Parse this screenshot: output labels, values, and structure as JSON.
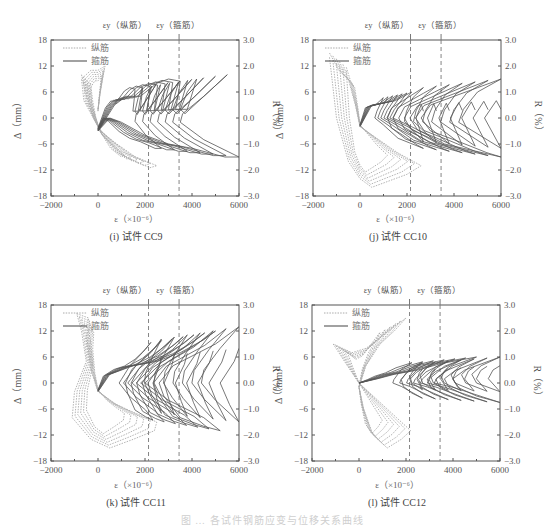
{
  "figure": {
    "caption": "图 … 各试件钢筋应变与位移关系曲线"
  },
  "colors": {
    "longitudinal": "#aaaaaa",
    "stirrup": "#555555",
    "axis": "#555555",
    "yield_line": "#777777"
  },
  "chart_data": [
    {
      "type": "line",
      "title": "(i) 试件 CC9",
      "xlabel": "ε（×10⁻⁶）",
      "ylabel": "Δ（mm）",
      "ylabel_right": "R（%）",
      "xlim": [
        -2000,
        6000
      ],
      "ylim": [
        -18,
        18
      ],
      "ylim_right": [
        -3.0,
        3.0
      ],
      "xticks": [
        -2000,
        0,
        2000,
        4000,
        6000
      ],
      "yticks": [
        -18,
        -12,
        -6,
        0,
        6,
        12,
        18
      ],
      "yticks_right": [
        "-3.0",
        "-2.0",
        "-1.0",
        "0.0",
        "1.0",
        "2.0",
        "3.0"
      ],
      "legend": [
        "纵筋",
        "箍筋"
      ],
      "vlines": [
        {
          "x": 2150,
          "label": "εy（纵筋）"
        },
        {
          "x": 3450,
          "label": "εy（箍筋）"
        }
      ],
      "series": [
        {
          "name": "纵筋",
          "style": "dotted",
          "points": [
            [
              -700,
              10
            ],
            [
              -500,
              5
            ],
            [
              -200,
              0
            ],
            [
              100,
              -3
            ],
            [
              800,
              -6
            ],
            [
              1600,
              -9
            ],
            [
              2500,
              -11
            ],
            [
              2200,
              -11.5
            ],
            [
              1200,
              -9
            ],
            [
              200,
              -4
            ],
            [
              -600,
              4
            ],
            [
              -700,
              9
            ],
            [
              -300,
              11
            ],
            [
              0,
              11
            ],
            [
              300,
              12
            ],
            [
              100,
              6
            ],
            [
              0,
              2
            ]
          ]
        },
        {
          "name": "箍筋",
          "style": "solid",
          "points": [
            [
              0,
              -3
            ],
            [
              700,
              3
            ],
            [
              1200,
              5
            ],
            [
              1800,
              5
            ],
            [
              2500,
              8
            ],
            [
              3000,
              9
            ],
            [
              3500,
              8.5
            ],
            [
              3400,
              5
            ],
            [
              3300,
              2
            ],
            [
              3800,
              2
            ],
            [
              4200,
              9
            ],
            [
              3800,
              6
            ],
            [
              3500,
              2
            ],
            [
              3700,
              1
            ],
            [
              5500,
              10
            ],
            [
              4500,
              5
            ],
            [
              3600,
              1
            ],
            [
              3500,
              -1
            ],
            [
              4500,
              -5
            ],
            [
              6000,
              -9
            ],
            [
              5400,
              -9
            ],
            [
              4000,
              -7
            ],
            [
              3000,
              -6
            ],
            [
              2000,
              -4
            ],
            [
              1000,
              -1
            ],
            [
              500,
              0
            ],
            [
              0,
              -3
            ]
          ]
        }
      ]
    },
    {
      "type": "line",
      "title": "(j) 试件 CC10",
      "xlabel": "ε（×10⁻⁶）",
      "ylabel": "Δ（mm）",
      "ylabel_right": "R（%）",
      "xlim": [
        -2000,
        6000
      ],
      "ylim": [
        -18,
        18
      ],
      "ylim_right": [
        -3.0,
        3.0
      ],
      "xticks": [
        -2000,
        0,
        2000,
        4000,
        6000
      ],
      "yticks": [
        -18,
        -12,
        -6,
        0,
        6,
        12,
        18
      ],
      "yticks_right": [
        "-3.0",
        "-2.0",
        "-1.0",
        "0.0",
        "1.0",
        "2.0",
        "3.0"
      ],
      "legend": [
        "纵筋",
        "箍筋"
      ],
      "vlines": [
        {
          "x": 2150,
          "label": "εy（纵筋）"
        },
        {
          "x": 3450,
          "label": "εy（箍筋）"
        }
      ],
      "series": [
        {
          "name": "纵筋",
          "style": "dotted",
          "points": [
            [
              -1300,
              15
            ],
            [
              -900,
              11
            ],
            [
              -500,
              9
            ],
            [
              -200,
              3
            ],
            [
              0,
              -2
            ],
            [
              800,
              -5
            ],
            [
              1600,
              -8
            ],
            [
              2600,
              -11
            ],
            [
              2000,
              -13
            ],
            [
              1000,
              -15
            ],
            [
              500,
              -16
            ],
            [
              0,
              -14
            ],
            [
              -500,
              -10
            ],
            [
              -1000,
              0
            ],
            [
              -1300,
              14
            ]
          ]
        },
        {
          "name": "箍筋",
          "style": "solid",
          "points": [
            [
              0,
              -2
            ],
            [
              500,
              3
            ],
            [
              1500,
              4
            ],
            [
              2200,
              6
            ],
            [
              1600,
              2
            ],
            [
              1400,
              0
            ],
            [
              2200,
              -2
            ],
            [
              3600,
              -6
            ],
            [
              6000,
              -9
            ],
            [
              5400,
              -8
            ],
            [
              4000,
              -5
            ],
            [
              3000,
              -3
            ],
            [
              2600,
              0
            ],
            [
              3000,
              3
            ],
            [
              4000,
              5
            ],
            [
              5000,
              7
            ],
            [
              6000,
              9
            ],
            [
              5000,
              6
            ],
            [
              4400,
              2
            ],
            [
              4200,
              -1
            ],
            [
              6000,
              -7
            ],
            [
              5600,
              -3
            ],
            [
              5300,
              0
            ],
            [
              5800,
              4
            ],
            [
              6000,
              2
            ]
          ]
        }
      ]
    },
    {
      "type": "line",
      "title": "(k) 试件 CC11",
      "xlabel": "ε（×10⁻⁶）",
      "ylabel": "Δ（mm）",
      "ylabel_right": "R（%）",
      "xlim": [
        -2000,
        6000
      ],
      "ylim": [
        -18,
        18
      ],
      "ylim_right": [
        -3.0,
        3.0
      ],
      "xticks": [
        -2000,
        0,
        2000,
        4000,
        6000
      ],
      "yticks": [
        -18,
        -12,
        -6,
        0,
        6,
        12,
        18
      ],
      "yticks_right": [
        "-3.0",
        "-2.0",
        "-1.0",
        "0.0",
        "1.0",
        "2.0",
        "3.0"
      ],
      "legend": [
        "纵筋",
        "箍筋"
      ],
      "vlines": [
        {
          "x": 2150,
          "label": "εy（纵筋）"
        },
        {
          "x": 3450,
          "label": "εy（箍筋）"
        }
      ],
      "series": [
        {
          "name": "纵筋",
          "style": "dotted",
          "points": [
            [
              -900,
              16
            ],
            [
              -400,
              15
            ],
            [
              -500,
              10
            ],
            [
              -300,
              3
            ],
            [
              0,
              -2
            ],
            [
              800,
              -5
            ],
            [
              1600,
              -7
            ],
            [
              2500,
              -9
            ],
            [
              2400,
              -11
            ],
            [
              1500,
              -13
            ],
            [
              500,
              -15
            ],
            [
              -300,
              -13
            ],
            [
              -1100,
              -8
            ],
            [
              -1000,
              -2
            ],
            [
              -500,
              5
            ],
            [
              -700,
              12
            ],
            [
              -900,
              16
            ]
          ]
        },
        {
          "name": "箍筋",
          "style": "solid",
          "points": [
            [
              0,
              -2
            ],
            [
              500,
              2
            ],
            [
              1500,
              4
            ],
            [
              2500,
              5
            ],
            [
              3500,
              7
            ],
            [
              4500,
              10
            ],
            [
              5000,
              12
            ],
            [
              4200,
              9
            ],
            [
              3000,
              5
            ],
            [
              2200,
              1
            ],
            [
              2000,
              0
            ],
            [
              3000,
              -4
            ],
            [
              4500,
              -8
            ],
            [
              5200,
              -11
            ],
            [
              4500,
              -10
            ],
            [
              3500,
              -8
            ],
            [
              2800,
              -3
            ],
            [
              2600,
              0
            ],
            [
              3200,
              4
            ],
            [
              5000,
              9
            ],
            [
              6000,
              13
            ],
            [
              5200,
              8
            ],
            [
              4500,
              3
            ],
            [
              4400,
              0
            ],
            [
              5000,
              -4
            ],
            [
              6000,
              -9
            ],
            [
              5600,
              -5
            ],
            [
              5200,
              0
            ],
            [
              5800,
              5
            ],
            [
              6000,
              8
            ]
          ]
        }
      ]
    },
    {
      "type": "line",
      "title": "(l) 试件 CC12",
      "xlabel": "ε（×10⁻⁶）",
      "ylabel": "Δ（mm）",
      "ylabel_right": "R（%）",
      "xlim": [
        -2000,
        6000
      ],
      "ylim": [
        -18,
        18
      ],
      "ylim_right": [
        -3.0,
        3.0
      ],
      "xticks": [
        -2000,
        0,
        2000,
        4000,
        6000
      ],
      "yticks": [
        -18,
        -12,
        -6,
        0,
        6,
        12,
        18
      ],
      "yticks_right": [
        "-3.0",
        "-2.0",
        "-1.0",
        "0.0",
        "1.0",
        "2.0",
        "3.0"
      ],
      "legend": [
        "纵筋",
        "箍筋"
      ],
      "vlines": [
        {
          "x": 2150,
          "label": "εy（纵筋）"
        },
        {
          "x": 3450,
          "label": "εy（箍筋）"
        }
      ],
      "series": [
        {
          "name": "纵筋",
          "style": "dotted",
          "points": [
            [
              -1100,
              9
            ],
            [
              -500,
              4
            ],
            [
              0,
              0
            ],
            [
              800,
              -4
            ],
            [
              1600,
              -8
            ],
            [
              2200,
              -11
            ],
            [
              1800,
              -13
            ],
            [
              1200,
              -15
            ],
            [
              600,
              -12
            ],
            [
              200,
              -6
            ],
            [
              0,
              -1
            ],
            [
              300,
              4
            ],
            [
              900,
              9
            ],
            [
              1500,
              12
            ],
            [
              2000,
              15
            ],
            [
              1500,
              13
            ],
            [
              800,
              10
            ],
            [
              300,
              8
            ],
            [
              -300,
              7
            ],
            [
              -1100,
              9
            ]
          ]
        },
        {
          "name": "箍筋",
          "style": "solid",
          "points": [
            [
              0,
              0
            ],
            [
              800,
              1
            ],
            [
              1500,
              2
            ],
            [
              2500,
              3
            ],
            [
              3500,
              4.5
            ],
            [
              5000,
              6
            ],
            [
              4000,
              4
            ],
            [
              3300,
              1
            ],
            [
              3200,
              0
            ],
            [
              4000,
              -1
            ],
            [
              6000,
              -4.5
            ],
            [
              5000,
              -3
            ],
            [
              4200,
              -1
            ],
            [
              4000,
              1
            ],
            [
              4500,
              3
            ],
            [
              6000,
              6
            ],
            [
              5200,
              4
            ],
            [
              4800,
              2
            ],
            [
              5000,
              0
            ],
            [
              6000,
              -2
            ],
            [
              5500,
              1
            ],
            [
              5700,
              3
            ],
            [
              6000,
              4
            ]
          ]
        }
      ]
    }
  ]
}
